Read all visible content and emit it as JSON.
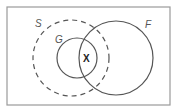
{
  "diagram": {
    "type": "venn",
    "frame": {
      "x": 7,
      "y": 7,
      "width": 163,
      "height": 98,
      "stroke": "#9a9a9a"
    },
    "sets": [
      {
        "id": "S",
        "label": "S",
        "style": "dashed",
        "cx": 71,
        "cy": 58,
        "r": 38,
        "stroke": "#555555",
        "label_x": 35,
        "label_y": 27
      },
      {
        "id": "G",
        "label": "G",
        "style": "solid",
        "cx": 77,
        "cy": 58,
        "r": 20,
        "stroke": "#555555",
        "label_x": 55,
        "label_y": 43
      },
      {
        "id": "F",
        "label": "F",
        "style": "solid",
        "cx": 116,
        "cy": 58,
        "r": 37,
        "stroke": "#555555",
        "label_x": 145,
        "label_y": 28
      }
    ],
    "elements": [
      {
        "label": "X",
        "x": 86,
        "y": 62,
        "region": "G ∩ F ∩ S"
      }
    ]
  }
}
